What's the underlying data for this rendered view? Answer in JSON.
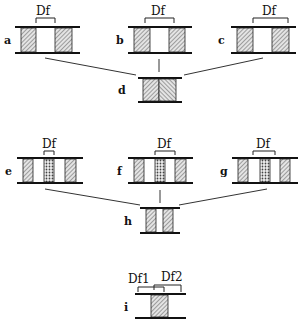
{
  "labels": {
    "a": "a",
    "b": "b",
    "c": "c",
    "d": "d",
    "e": "e",
    "f": "f",
    "g": "g",
    "h": "h",
    "i": "i"
  },
  "bracket_text": {
    "df": "Df",
    "df1": "Df1",
    "df2": "Df2"
  },
  "colors": {
    "line": "#111111",
    "hatch": "#555555",
    "background": "#ffffff"
  }
}
